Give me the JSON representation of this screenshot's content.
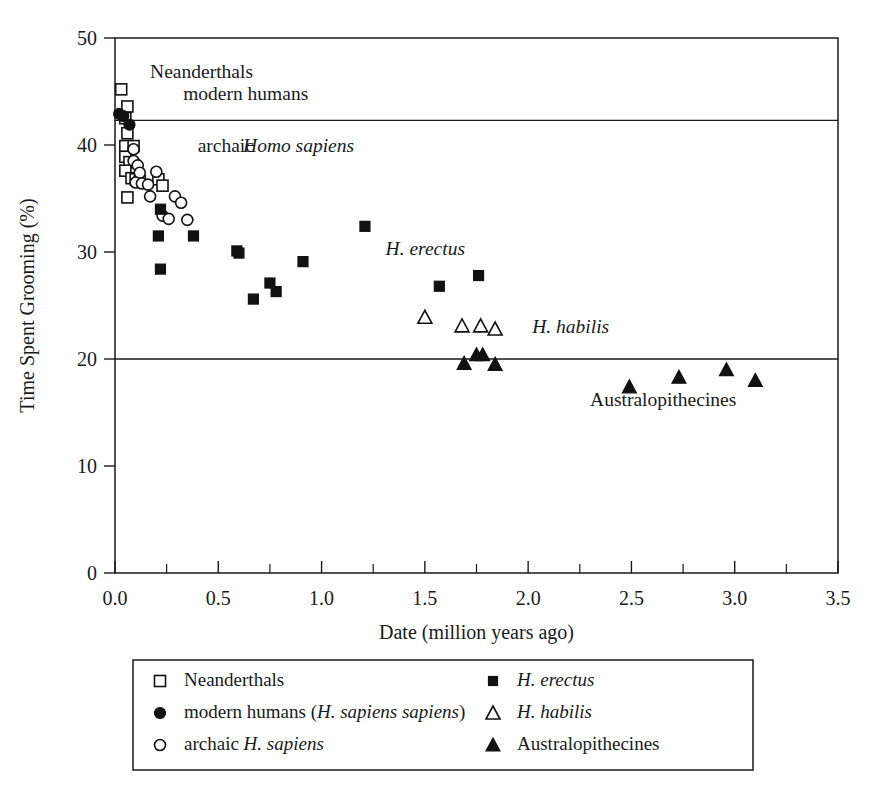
{
  "chart_data": {
    "type": "scatter",
    "title": "",
    "xlabel": "Date (million years ago)",
    "ylabel": "Time Spent Grooming (%)",
    "xlim": [
      0.0,
      3.5
    ],
    "ylim": [
      0,
      50
    ],
    "xticks": [
      "0.0",
      "0.5",
      "1.0",
      "1.5",
      "2.0",
      "2.5",
      "3.0",
      "3.5"
    ],
    "xtick_values": [
      0.0,
      0.5,
      1.0,
      1.5,
      2.0,
      2.5,
      3.0,
      3.5
    ],
    "yticks": [
      "0",
      "10",
      "20",
      "30",
      "40",
      "50"
    ],
    "ytick_values": [
      0,
      10,
      20,
      30,
      40,
      50
    ],
    "grid": false,
    "minor_xticks": [
      0.25,
      0.75,
      1.25,
      1.75,
      2.25,
      2.75,
      3.25
    ],
    "reference_lines": [
      {
        "name": "upper-reference-line",
        "y": 42.3
      },
      {
        "name": "lower-reference-line",
        "y": 20.0
      }
    ],
    "legend_position": "below-plot",
    "series": [
      {
        "name": "Neanderthals",
        "marker": "open-square",
        "points": [
          [
            0.03,
            45.2
          ],
          [
            0.06,
            43.6
          ],
          [
            0.05,
            42.5
          ],
          [
            0.06,
            41.1
          ],
          [
            0.05,
            39.9
          ],
          [
            0.09,
            39.9
          ],
          [
            0.05,
            38.9
          ],
          [
            0.07,
            38.4
          ],
          [
            0.05,
            37.6
          ],
          [
            0.08,
            36.9
          ],
          [
            0.1,
            36.8
          ],
          [
            0.12,
            36.6
          ],
          [
            0.06,
            35.1
          ],
          [
            0.21,
            36.8
          ],
          [
            0.23,
            36.2
          ]
        ]
      },
      {
        "name": "modern humans (H. sapiens sapiens)",
        "marker": "filled-circle",
        "points": [
          [
            0.02,
            42.9
          ],
          [
            0.04,
            42.7
          ],
          [
            0.07,
            41.9
          ]
        ]
      },
      {
        "name": "archaic H. sapiens",
        "marker": "open-circle",
        "points": [
          [
            0.09,
            39.6
          ],
          [
            0.09,
            38.5
          ],
          [
            0.11,
            38.1
          ],
          [
            0.12,
            37.4
          ],
          [
            0.1,
            36.5
          ],
          [
            0.13,
            36.4
          ],
          [
            0.16,
            36.3
          ],
          [
            0.2,
            37.5
          ],
          [
            0.17,
            35.2
          ],
          [
            0.29,
            35.2
          ],
          [
            0.32,
            34.6
          ],
          [
            0.23,
            33.4
          ],
          [
            0.26,
            33.1
          ],
          [
            0.35,
            33.0
          ]
        ]
      },
      {
        "name": "H. erectus",
        "marker": "filled-square",
        "points": [
          [
            0.22,
            34.0
          ],
          [
            0.21,
            31.5
          ],
          [
            0.22,
            28.4
          ],
          [
            0.38,
            31.5
          ],
          [
            0.59,
            30.1
          ],
          [
            0.6,
            29.9
          ],
          [
            0.67,
            25.6
          ],
          [
            0.75,
            27.1
          ],
          [
            0.78,
            26.3
          ],
          [
            0.91,
            29.1
          ],
          [
            1.21,
            32.4
          ],
          [
            1.57,
            26.8
          ],
          [
            1.76,
            27.8
          ]
        ]
      },
      {
        "name": "H. habilis",
        "marker": "open-triangle",
        "points": [
          [
            1.5,
            23.9
          ],
          [
            1.68,
            23.1
          ],
          [
            1.77,
            23.1
          ],
          [
            1.84,
            22.8
          ]
        ]
      },
      {
        "name": "Australopithecines",
        "marker": "filled-triangle",
        "points": [
          [
            1.69,
            19.6
          ],
          [
            1.75,
            20.4
          ],
          [
            1.78,
            20.4
          ],
          [
            1.84,
            19.5
          ],
          [
            2.49,
            17.4
          ],
          [
            2.73,
            18.3
          ],
          [
            2.96,
            19.0
          ],
          [
            3.1,
            18.0
          ]
        ]
      }
    ],
    "annotations": [
      {
        "name": "annotation-neanderthals",
        "text": "Neanderthals",
        "x": 0.17,
        "y": 46.3,
        "italic": false
      },
      {
        "name": "annotation-modern-humans",
        "text": "modern humans",
        "x": 0.33,
        "y": 44.2,
        "italic": false
      },
      {
        "name": "annotation-archaic-prefix",
        "text": "archaic ",
        "x": 0.4,
        "y": 39.3,
        "italic": false
      },
      {
        "name": "annotation-archaic-italic",
        "text": "Homo sapiens",
        "x": 0.62,
        "y": 39.3,
        "italic": true
      },
      {
        "name": "annotation-h-erectus",
        "text": "H. erectus",
        "x": 1.31,
        "y": 29.7,
        "italic": true
      },
      {
        "name": "annotation-h-habilis",
        "text": "H. habilis",
        "x": 2.02,
        "y": 22.4,
        "italic": true
      },
      {
        "name": "annotation-australopithecines",
        "text": "Australopithecines",
        "x": 2.3,
        "y": 15.6,
        "italic": false
      }
    ],
    "legend_entries": [
      {
        "name": "legend-neanderthals",
        "label": "Neanderthals",
        "marker": "open-square",
        "column": 0,
        "row": 0,
        "italic_part": ""
      },
      {
        "name": "legend-modern-humans",
        "label_plain": "modern humans (",
        "label_italic": "H. sapiens sapiens",
        "label_tail": ")",
        "marker": "filled-circle",
        "column": 0,
        "row": 1
      },
      {
        "name": "legend-archaic-h-sapiens",
        "label_plain": "archaic ",
        "label_italic": "H. sapiens",
        "label_tail": "",
        "marker": "open-circle",
        "column": 0,
        "row": 2
      },
      {
        "name": "legend-h-erectus",
        "label_plain": "",
        "label_italic": "H. erectus",
        "label_tail": "",
        "marker": "filled-square",
        "column": 1,
        "row": 0
      },
      {
        "name": "legend-h-habilis",
        "label_plain": "",
        "label_italic": "H. habilis",
        "label_tail": "",
        "marker": "open-triangle",
        "column": 1,
        "row": 1
      },
      {
        "name": "legend-australopithecines",
        "label_plain": "Australopithecines",
        "label_italic": "",
        "label_tail": "",
        "marker": "filled-triangle",
        "column": 1,
        "row": 2
      }
    ]
  },
  "colors": {
    "ink": "#1a1a1a",
    "marker_fill": "#111111",
    "marker_open": "#ffffff",
    "background": "#ffffff"
  }
}
